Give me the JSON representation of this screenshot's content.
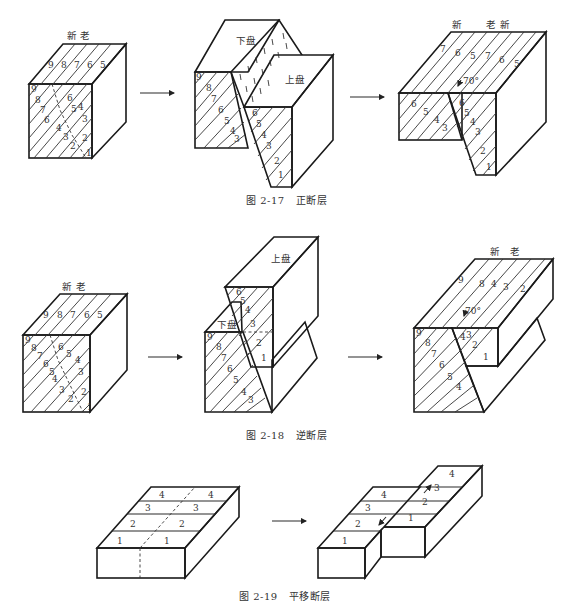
{
  "figures": [
    {
      "id": "2-17",
      "caption": "图 2-17   正断层",
      "panels": [
        {
          "name": "before",
          "top_labels": [
            "新",
            "老"
          ],
          "top_beds": [
            "9",
            "8",
            "7",
            "6",
            "5"
          ],
          "front_beds": [
            "9",
            "8",
            "7",
            "6",
            "5",
            "4",
            "3",
            "2",
            "1"
          ]
        },
        {
          "name": "faulted",
          "block_labels": {
            "footwall": "下盘",
            "hanging_wall": "上盘"
          },
          "front_left_beds": [
            "9",
            "8",
            "7",
            "6",
            "5",
            "4",
            "3",
            "2"
          ],
          "front_right_beds": [
            "7",
            "6",
            "5",
            "4",
            "3",
            "2",
            "1"
          ]
        },
        {
          "name": "eroded",
          "top_labels": [
            "新",
            "老",
            "新"
          ],
          "top_beds": [
            "7",
            "6",
            "5",
            "7",
            "6",
            "5"
          ],
          "dip_angle": "70°",
          "front_left_beds": [
            "7",
            "6",
            "5",
            "4",
            "3",
            "2"
          ],
          "front_right_beds": [
            "7",
            "6",
            "5",
            "4",
            "3",
            "2",
            "1"
          ]
        }
      ]
    },
    {
      "id": "2-18",
      "caption": "图 2-18   逆断层",
      "panels": [
        {
          "name": "before",
          "top_labels": [
            "新",
            "老"
          ],
          "top_beds": [
            "9",
            "8",
            "7",
            "6",
            "5"
          ],
          "front_beds": [
            "9",
            "8",
            "7",
            "6",
            "5",
            "4",
            "3",
            "2",
            "1"
          ]
        },
        {
          "name": "faulted",
          "block_labels": {
            "hanging_wall": "上盘",
            "footwall": "下盘"
          },
          "upper_beds": [
            "7",
            "6",
            "5",
            "4",
            "3",
            "2",
            "1"
          ],
          "lower_beds": [
            "9",
            "8",
            "7",
            "6",
            "5",
            "4",
            "3",
            "2"
          ]
        },
        {
          "name": "eroded",
          "top_labels": [
            "新",
            "老"
          ],
          "top_beds": [
            "9",
            "8",
            "4",
            "3",
            "2"
          ],
          "dip_angle": "70°",
          "front_left_beds": [
            "9",
            "8",
            "7",
            "6",
            "5",
            "4",
            "3",
            "2"
          ],
          "front_right_beds": [
            "4",
            "3",
            "2",
            "1"
          ]
        }
      ]
    },
    {
      "id": "2-19",
      "caption": "图 2-19   平移断层",
      "panels": [
        {
          "name": "before",
          "strips_left": [
            "4",
            "3",
            "2",
            "1"
          ],
          "strips_right": [
            "4",
            "3",
            "2",
            "1"
          ]
        },
        {
          "name": "displaced",
          "strips_left": [
            "4",
            "3",
            "2",
            "1"
          ],
          "strips_right": [
            "4",
            "3",
            "2",
            "1"
          ]
        }
      ]
    }
  ],
  "labels": {
    "new": "新",
    "old": "老",
    "footwall": "下盘",
    "hanging_wall": "上盘",
    "angle": "70°",
    "n1": "1",
    "n2": "2",
    "n3": "3",
    "n4": "4",
    "n5": "5",
    "n6": "6",
    "n7": "7",
    "n8": "8",
    "n9": "9"
  },
  "colors": {
    "line": "#2a2a2a",
    "background": "#ffffff"
  }
}
